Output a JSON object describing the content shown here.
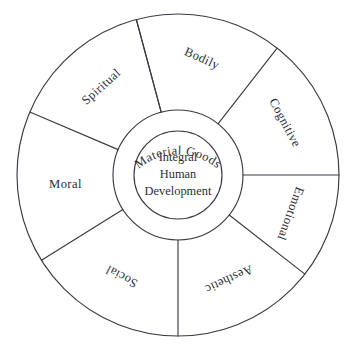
{
  "figure": {
    "name": "integral-human-development-wheel",
    "background_color": "#ffffff",
    "stroke_color": "#3a3a44",
    "text_color": "#2e2e36"
  },
  "core": {
    "lines": [
      "Integral",
      "Human",
      "Development"
    ],
    "line1": "Integral",
    "line2": "Human",
    "line3": "Development"
  },
  "ring": {
    "label": "Material Goods"
  },
  "sectors": [
    {
      "label": "Bodily",
      "start_deg": -15,
      "end_deg": 38,
      "mid_deg": 11.5,
      "label_radius": 118,
      "rotation": 24
    },
    {
      "label": "Cognitive",
      "start_deg": 38,
      "end_deg": 90,
      "mid_deg": 64,
      "label_radius": 118,
      "rotation": 62
    },
    {
      "label": "Emotional",
      "start_deg": 90,
      "end_deg": 128,
      "mid_deg": 109,
      "label_radius": 118,
      "rotation": 110
    },
    {
      "label": "Aesthetic",
      "start_deg": 128,
      "end_deg": 180,
      "mid_deg": 154,
      "label_radius": 115,
      "rotation": 155
    },
    {
      "label": "Social",
      "start_deg": 180,
      "end_deg": 238,
      "mid_deg": 209,
      "label_radius": 115,
      "rotation": 208
    },
    {
      "label": "Moral",
      "start_deg": 238,
      "end_deg": 293,
      "mid_deg": 265,
      "label_radius": 113,
      "rotation": 0
    },
    {
      "label": "Spiritual",
      "start_deg": 293,
      "end_deg": 345,
      "mid_deg": 319,
      "label_radius": 116,
      "rotation": 318
    }
  ],
  "geometry": {
    "center_x": 178,
    "center_y": 175,
    "outer_radius": 161,
    "ring_radius": 65,
    "core_radius": 44,
    "spoke_angles_deg": [
      -15,
      38,
      90,
      128,
      180,
      238,
      293,
      345
    ]
  }
}
